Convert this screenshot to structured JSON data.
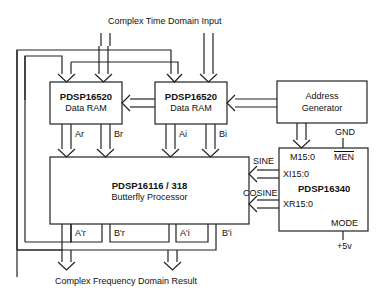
{
  "diagram": {
    "input_label": "Complex Time Domain Input",
    "output_label": "Complex Frequency Domain Result",
    "blocks": {
      "ram_left": {
        "part": "PDSP16520",
        "name": "Data RAM"
      },
      "ram_right": {
        "part": "PDSP16520",
        "name": "Data RAM"
      },
      "address_gen": {
        "line1": "Address",
        "line2": "Generator"
      },
      "butterfly": {
        "part": "PDSP16116 / 318",
        "name": "Butterfly Processor"
      },
      "nco": {
        "part": "PDSP16340",
        "pins": {
          "m": "M15:0",
          "men": "MEN",
          "xi": "XI15:0",
          "xr": "XR15:0",
          "mode": "MODE"
        }
      }
    },
    "signals": {
      "ar": "Ar",
      "br": "Br",
      "ai": "Ai",
      "bi": "Bi",
      "ar_out": "A'r",
      "br_out": "B'r",
      "ai_out": "A'i",
      "bi_out": "B'i",
      "sine": "SINE",
      "cosine": "COSINE",
      "gnd": "GND",
      "vcc": "+5v"
    }
  }
}
